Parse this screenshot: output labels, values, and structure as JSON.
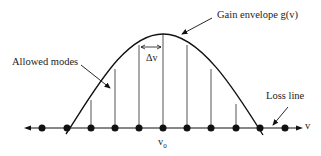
{
  "diagram": {
    "labels": {
      "gain_envelope": "Gain envelope g(v)",
      "allowed_modes": "Allowed modes",
      "delta_v": "Δv",
      "loss_line": "Loss line",
      "axis_v": "v",
      "center_freq": "v",
      "center_freq_sub": "0"
    },
    "mode_positions_x": [
      42,
      67,
      91,
      115,
      139,
      163,
      187,
      211,
      236,
      260,
      285
    ],
    "colors": {
      "line": "#111111",
      "mode_line": "#555555"
    }
  }
}
